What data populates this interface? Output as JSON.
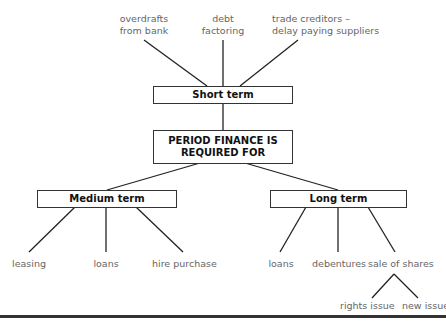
{
  "diagram": {
    "root": "PERIOD FINANCE IS REQUIRED FOR",
    "root_line1": "PERIOD FINANCE IS",
    "root_line2": "REQUIRED FOR",
    "short_term": {
      "label": "Short term",
      "children": [
        {
          "line1": "overdrafts",
          "line2": "from bank"
        },
        {
          "line1": "debt",
          "line2": "factoring"
        },
        {
          "line1": "trade creditors –",
          "line2": "delay paying suppliers"
        }
      ]
    },
    "medium_term": {
      "label": "Medium term",
      "children": [
        "leasing",
        "loans",
        "hire purchase"
      ]
    },
    "long_term": {
      "label": "Long term",
      "children": [
        "loans",
        "debentures",
        "sale of shares"
      ],
      "sale_of_shares_children": [
        "rights issue",
        "new issue"
      ]
    }
  }
}
